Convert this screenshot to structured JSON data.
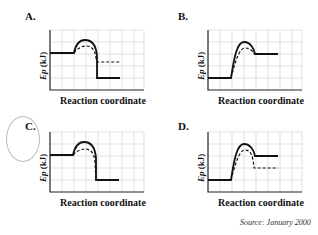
{
  "panels": [
    {
      "letter": "A.",
      "xlabel": "Reaction coordinate",
      "ylabel_var": "Ep",
      "ylabel_unit": " (kJ)",
      "type": "exothermic",
      "catalyzed_product_differs": true
    },
    {
      "letter": "B.",
      "xlabel": "Reaction coordinate",
      "ylabel_var": "Ep",
      "ylabel_unit": " (kJ)",
      "type": "endothermic",
      "catalyzed_product_differs": false
    },
    {
      "letter": "C.",
      "xlabel": "Reaction coordinate",
      "ylabel_var": "Ep",
      "ylabel_unit": " (kJ)",
      "type": "exothermic",
      "catalyzed_product_differs": false
    },
    {
      "letter": "D.",
      "xlabel": "Reaction coordinate",
      "ylabel_var": "Ep",
      "ylabel_unit": " (kJ)",
      "type": "endothermic",
      "catalyzed_product_differs": true
    }
  ],
  "source": "Source: January 2000",
  "selected_answer": "C."
}
